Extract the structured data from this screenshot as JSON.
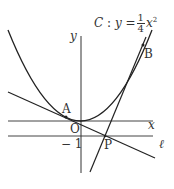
{
  "figure": {
    "curve_label": {
      "name": "C",
      "colon": ":",
      "lhs": "y",
      "eq": "=",
      "frac_num": "1",
      "frac_den": "4",
      "var": "x",
      "exp": "2"
    },
    "axes": {
      "x_label": "x",
      "y_label": "y",
      "origin_label": "O"
    },
    "points": {
      "A": "A",
      "B": "B",
      "P": "P"
    },
    "line_l_label": "ℓ",
    "tick_label": "− 1",
    "colors": {
      "stroke": "#2a2a2a",
      "text": "#333333"
    }
  }
}
